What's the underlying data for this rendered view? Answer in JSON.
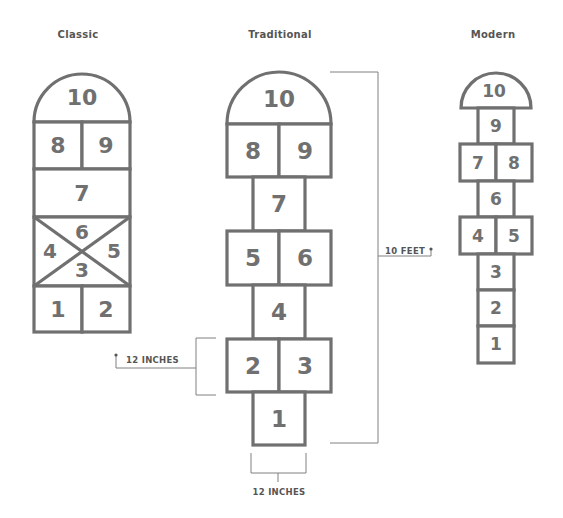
{
  "diagram": {
    "titles": {
      "classic": "Classic",
      "traditional": "Traditional",
      "modern": "Modern"
    },
    "classic": {
      "squares": [
        "10",
        "8",
        "9",
        "7",
        "6",
        "4",
        "5",
        "3",
        "1",
        "2"
      ]
    },
    "traditional": {
      "squares": [
        "10",
        "8",
        "9",
        "7",
        "5",
        "6",
        "4",
        "2",
        "3",
        "1"
      ]
    },
    "modern": {
      "squares": [
        "10",
        "9",
        "7",
        "8",
        "6",
        "4",
        "5",
        "3",
        "2",
        "1"
      ]
    },
    "dimensions": {
      "height_label": "10 FEET",
      "square_height_label": "12 INCHES",
      "square_width_label": "12 INCHES"
    }
  }
}
